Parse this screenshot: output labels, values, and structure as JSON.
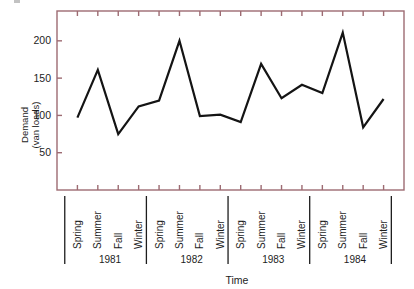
{
  "chart_data": {
    "type": "line",
    "title": "",
    "xlabel": "Time",
    "ylabel": "Demand\n(van loads)",
    "ylabel_line1": "Demand",
    "ylabel_line2": "(van loads)",
    "ylim": [
      0,
      240
    ],
    "yticks": [
      50,
      100,
      150,
      200
    ],
    "ytick_labels": [
      "50",
      "100",
      "150",
      "200"
    ],
    "grid": false,
    "legend": "none",
    "categories": [
      "Spring",
      "Summer",
      "Fall",
      "Winter",
      "Spring",
      "Summer",
      "Fall",
      "Winter",
      "Spring",
      "Summer",
      "Fall",
      "Winter",
      "Spring",
      "Summer",
      "Fall",
      "Winter"
    ],
    "groups": [
      {
        "label": "1981",
        "count": 4
      },
      {
        "label": "1982",
        "count": 4
      },
      {
        "label": "1983",
        "count": 4
      },
      {
        "label": "1984",
        "count": 4
      }
    ],
    "values": [
      97,
      161,
      75,
      112,
      120,
      200,
      99,
      101,
      91,
      169,
      123,
      141,
      130,
      211,
      84,
      122
    ],
    "series": [
      {
        "name": "Demand (van loads)",
        "values": [
          97,
          161,
          75,
          112,
          120,
          200,
          99,
          101,
          91,
          169,
          123,
          141,
          130,
          211,
          84,
          122
        ]
      }
    ],
    "points": [
      {
        "period": "Spring 1981",
        "year": "1981",
        "season": "Spring",
        "value": 97
      },
      {
        "period": "Summer 1981",
        "year": "1981",
        "season": "Summer",
        "value": 161
      },
      {
        "period": "Fall 1981",
        "year": "1981",
        "season": "Fall",
        "value": 75
      },
      {
        "period": "Winter 1981",
        "year": "1981",
        "season": "Winter",
        "value": 112
      },
      {
        "period": "Spring 1982",
        "year": "1982",
        "season": "Spring",
        "value": 120
      },
      {
        "period": "Summer 1982",
        "year": "1982",
        "season": "Summer",
        "value": 200
      },
      {
        "period": "Fall 1982",
        "year": "1982",
        "season": "Fall",
        "value": 99
      },
      {
        "period": "Winter 1982",
        "year": "1982",
        "season": "Winter",
        "value": 101
      },
      {
        "period": "Spring 1983",
        "year": "1983",
        "season": "Spring",
        "value": 91
      },
      {
        "period": "Summer 1983",
        "year": "1983",
        "season": "Summer",
        "value": 169
      },
      {
        "period": "Fall 1983",
        "year": "1983",
        "season": "Fall",
        "value": 123
      },
      {
        "period": "Winter 1983",
        "year": "1983",
        "season": "Winter",
        "value": 141
      },
      {
        "period": "Spring 1984",
        "year": "1984",
        "season": "Spring",
        "value": 130
      },
      {
        "period": "Summer 1984",
        "year": "1984",
        "season": "Summer",
        "value": 211
      },
      {
        "period": "Fall 1984",
        "year": "1984",
        "season": "Fall",
        "value": 84
      },
      {
        "period": "Winter 1984",
        "year": "1984",
        "season": "Winter",
        "value": 122
      }
    ]
  },
  "colors": {
    "frame": "#9d6b72",
    "line": "#141414",
    "text": "#1d1d1d",
    "background": "#ffffff",
    "separator": "#1d1d1d"
  }
}
